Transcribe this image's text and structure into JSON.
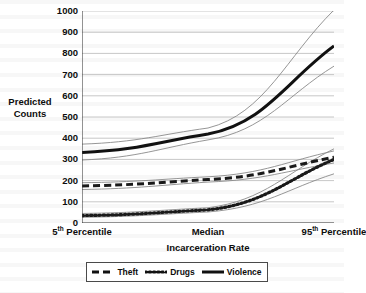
{
  "chart_data": {
    "type": "line",
    "title": "",
    "xlabel": "Incarceration Rate",
    "ylabel": "Predicted Counts",
    "ylim": [
      0,
      1000
    ],
    "ytick_labels": [
      "1000",
      "900",
      "800",
      "700",
      "600",
      "500",
      "400",
      "300",
      "200",
      "100",
      "0"
    ],
    "ytick_values": [
      1000,
      900,
      800,
      700,
      600,
      500,
      400,
      300,
      200,
      100,
      0
    ],
    "grid": "horizontal",
    "legend_position": "bottom",
    "x": [
      0,
      0.5,
      1
    ],
    "categories": [
      "5th Percentile",
      "Median",
      "95th Percentile"
    ],
    "xtick_labels": [
      {
        "text": "5",
        "sup": "th",
        "rest": " Percentile"
      },
      {
        "text": "Median",
        "sup": "",
        "rest": ""
      },
      {
        "text": "95",
        "sup": "th",
        "rest": " Percentile"
      }
    ],
    "series": [
      {
        "name": "Theft",
        "style": "dashed",
        "color": "#1a1a1a",
        "values": [
          175,
          205,
          310
        ],
        "ci_upper": [
          190,
          218,
          340
        ],
        "ci_lower": [
          158,
          193,
          283
        ]
      },
      {
        "name": "Drugs",
        "style": "dotted",
        "color": "#1a1a1a",
        "values": [
          35,
          62,
          300
        ],
        "ci_upper": [
          45,
          72,
          350
        ],
        "ci_lower": [
          27,
          52,
          232
        ]
      },
      {
        "name": "Violence",
        "style": "solid",
        "color": "#111111",
        "values": [
          333,
          420,
          835
        ],
        "ci_upper": [
          372,
          448,
          1005
        ],
        "ci_lower": [
          297,
          392,
          740
        ]
      }
    ]
  },
  "legend": {
    "items": [
      {
        "label": "Theft",
        "style": "dashed"
      },
      {
        "label": "Drugs",
        "style": "dotted"
      },
      {
        "label": "Violence",
        "style": "solid"
      }
    ]
  },
  "axis": {
    "y_title_line1": "Predicted",
    "y_title_line2": "Counts",
    "x_title": "Incarceration Rate"
  }
}
